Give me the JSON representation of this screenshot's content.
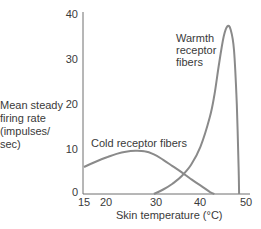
{
  "chart_data": {
    "type": "line",
    "title": "",
    "xlabel": "Skin temperature (°C)",
    "ylabel": "Mean steady firing rate (impulses/ sec)",
    "ylabel_lines": [
      "Mean steady",
      "firing rate",
      "(impulses/",
      "sec)"
    ],
    "xlim": [
      15,
      50
    ],
    "ylim": [
      0,
      40
    ],
    "x_ticks": [
      15,
      20,
      30,
      40,
      50
    ],
    "y_ticks": [
      0,
      10,
      20,
      30,
      40
    ],
    "grid": false,
    "legend": "none (inline annotations)",
    "series": [
      {
        "name": "Cold receptor fibers",
        "color": "#8a8a8a",
        "x": [
          15,
          18,
          20,
          22,
          24,
          26,
          28,
          30,
          32,
          34,
          36,
          38,
          40,
          42,
          43
        ],
        "y": [
          6,
          7.4,
          8.2,
          8.9,
          9.4,
          9.6,
          9.5,
          8.8,
          7.6,
          6.2,
          4.8,
          3.3,
          1.9,
          0.5,
          0
        ]
      },
      {
        "name": "Warmth receptor fibers",
        "color": "#8a8a8a",
        "x": [
          30,
          32,
          34,
          36,
          38,
          40,
          42,
          43,
          44,
          45,
          45.8,
          46.5,
          47.2,
          47.8,
          48.2,
          48.3
        ],
        "y": [
          0,
          1,
          2.3,
          4,
          6.5,
          10.5,
          17,
          22,
          29,
          35,
          37.3,
          36.5,
          32,
          20,
          6,
          0
        ]
      }
    ],
    "annotations": [
      {
        "text": "Cold receptor fibers",
        "near_x": 18,
        "near_y": 11
      },
      {
        "text_lines": [
          "Warmth",
          "receptor",
          "fibers"
        ],
        "near_x": 40,
        "near_y": 32
      }
    ]
  },
  "labels": {
    "ylabel_1": "Mean steady",
    "ylabel_2": "firing rate",
    "ylabel_3": "(impulses/",
    "ylabel_4": "sec)",
    "xlabel": "Skin temperature (°C)",
    "cold": "Cold receptor fibers",
    "warm_1": "Warmth",
    "warm_2": "receptor",
    "warm_3": "fibers",
    "yt0": "0",
    "yt10": "10",
    "yt20": "20",
    "yt30": "30",
    "yt40": "40",
    "xt15": "15",
    "xt20": "20",
    "xt30": "30",
    "xt40": "40",
    "xt50": "50"
  }
}
